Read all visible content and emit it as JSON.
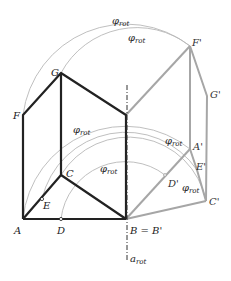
{
  "colors": {
    "original": "#222222",
    "rotated": "#a8a8a8",
    "arc": "#b5b5b5",
    "axis": "#333333"
  },
  "labels": {
    "A": "A",
    "B": "B = B'",
    "C": "C",
    "D": "D",
    "E": "E",
    "F": "F",
    "G": "G",
    "A_prime": "A'",
    "C_prime": "C'",
    "D_prime": "D'",
    "E_prime": "E'",
    "F_prime": "F'",
    "G_prime": "G'",
    "phi": "φ",
    "phi_sub": "rot",
    "axis": "a",
    "axis_sub": "rot"
  },
  "points": {
    "A": [
      23,
      219
    ],
    "D": [
      61,
      219
    ],
    "B": [
      126,
      219
    ],
    "C": [
      61,
      175
    ],
    "E": [
      42,
      199
    ],
    "F": [
      23,
      115
    ],
    "G": [
      61,
      73
    ],
    "H": [
      126,
      115
    ],
    "F_prime": [
      190,
      46
    ],
    "G_prime": [
      207,
      96
    ],
    "A_prime": [
      190,
      149
    ],
    "E_prime": [
      197,
      170
    ],
    "C_prime": [
      206,
      201
    ],
    "D_prime": [
      165,
      175
    ]
  }
}
